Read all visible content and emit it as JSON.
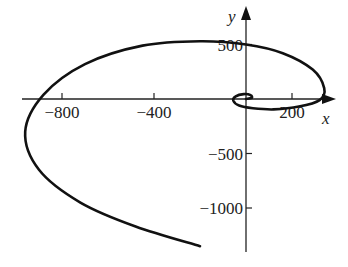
{
  "chart_data": {
    "type": "line",
    "subtype": "parametric-spiral",
    "title": "",
    "xlabel": "x",
    "ylabel": "y",
    "x_ticks": [
      -800,
      -400,
      200
    ],
    "y_ticks": [
      500,
      -500,
      -1000
    ],
    "x_tick_labels": [
      "−800",
      "−400",
      "200"
    ],
    "y_tick_labels": [
      "500",
      "−500",
      "−1000"
    ],
    "xlim": [
      -1050,
      400
    ],
    "ylim": [
      -1400,
      700
    ],
    "grid": false,
    "legend": null,
    "series": [
      {
        "name": "spiral",
        "description": "Outward spiral starting near origin, winding counter-clockwise with growing radius; ends lower-left near (-200, -1350)",
        "points": [
          [
            0,
            0
          ],
          [
            25,
            10
          ],
          [
            20,
            35
          ],
          [
            -10,
            45
          ],
          [
            -45,
            25
          ],
          [
            -55,
            -15
          ],
          [
            -30,
            -60
          ],
          [
            30,
            -85
          ],
          [
            120,
            -95
          ],
          [
            230,
            -70
          ],
          [
            320,
            -10
          ],
          [
            340,
            100
          ],
          [
            290,
            270
          ],
          [
            160,
            420
          ],
          [
            0,
            500
          ],
          [
            -200,
            530
          ],
          [
            -450,
            490
          ],
          [
            -700,
            320
          ],
          [
            -880,
            40
          ],
          [
            -960,
            -300
          ],
          [
            -900,
            -650
          ],
          [
            -720,
            -950
          ],
          [
            -480,
            -1170
          ],
          [
            -200,
            -1350
          ]
        ]
      }
    ]
  },
  "axes": {
    "x_label": "x",
    "y_label": "y"
  }
}
